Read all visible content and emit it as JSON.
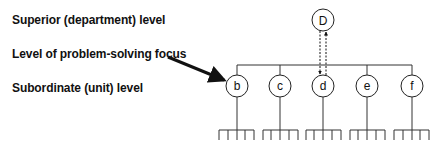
{
  "labels": {
    "superior": "Superior (department) level",
    "focus": "Level of problem-solving focus",
    "subordinate": "Subordinate (unit) level"
  },
  "nodes": {
    "top": "D",
    "children": [
      "b",
      "c",
      "d",
      "e",
      "f"
    ]
  },
  "colors": {
    "line": "#222222",
    "background": "#ffffff"
  }
}
